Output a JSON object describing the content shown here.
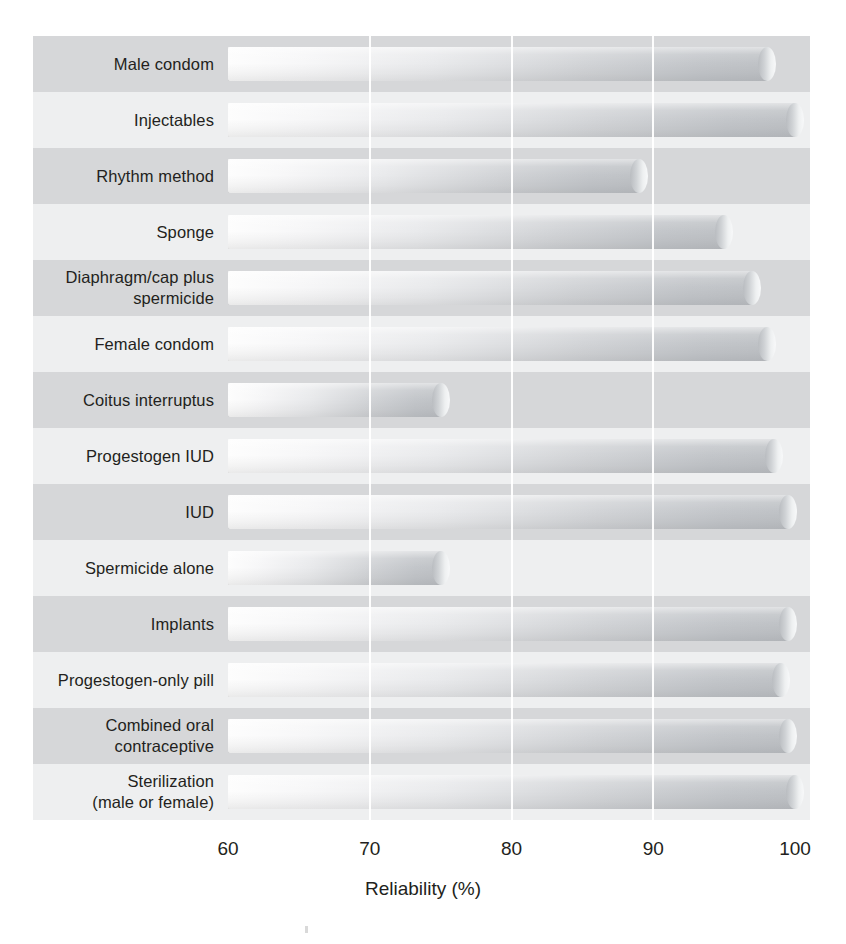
{
  "chart_data": {
    "type": "bar",
    "orientation": "horizontal",
    "title": "",
    "subtitle": "",
    "xlabel": "Reliability (%)",
    "ylabel": "",
    "xlim": [
      60,
      100
    ],
    "xticks": [
      60,
      70,
      80,
      90,
      100
    ],
    "xtick_labels": [
      "60",
      "70",
      "80",
      "90",
      "100"
    ],
    "grid": "vertical white gridlines at 70, 80, 90",
    "legend": "none",
    "bar_style": "3D cylindrical bars with left-to-right grey gradient and rounded right cap",
    "row_banding": "alternating light/dark grey horizontal bands",
    "categories": [
      "Male condom",
      "Injectables",
      "Rhythm method",
      "Sponge",
      "Diaphragm/cap plus spermicide",
      "Female condom",
      "Coitus interruptus",
      "Progestogen IUD",
      "IUD",
      "Spermicide alone",
      "Implants",
      "Progestogen-only pill",
      "Combined oral contraceptive",
      "Sterilization (male or female)"
    ],
    "values": [
      98,
      100,
      89,
      95,
      97,
      98,
      75,
      98.5,
      99.5,
      75,
      99.5,
      99,
      99.5,
      100
    ]
  },
  "axis": {
    "title": "Reliability (%)",
    "ticks": [
      {
        "label": "60",
        "value": 60
      },
      {
        "label": "70",
        "value": 70
      },
      {
        "label": "80",
        "value": 80
      },
      {
        "label": "90",
        "value": 90
      },
      {
        "label": "100",
        "value": 100
      }
    ]
  },
  "rows": [
    {
      "label_line1": "Male condom",
      "label_line2": "",
      "value": 98
    },
    {
      "label_line1": "Injectables",
      "label_line2": "",
      "value": 100
    },
    {
      "label_line1": "Rhythm method",
      "label_line2": "",
      "value": 89
    },
    {
      "label_line1": "Sponge",
      "label_line2": "",
      "value": 95
    },
    {
      "label_line1": "Diaphragm/cap plus",
      "label_line2": "spermicide",
      "value": 97
    },
    {
      "label_line1": "Female condom",
      "label_line2": "",
      "value": 98
    },
    {
      "label_line1": "Coitus interruptus",
      "label_line2": "",
      "value": 75
    },
    {
      "label_line1": "Progestogen IUD",
      "label_line2": "",
      "value": 98.5
    },
    {
      "label_line1": "IUD",
      "label_line2": "",
      "value": 99.5
    },
    {
      "label_line1": "Spermicide alone",
      "label_line2": "",
      "value": 75
    },
    {
      "label_line1": "Implants",
      "label_line2": "",
      "value": 99.5
    },
    {
      "label_line1": "Progestogen-only pill",
      "label_line2": "",
      "value": 99
    },
    {
      "label_line1": "Combined oral",
      "label_line2": "contraceptive",
      "value": 99.5
    },
    {
      "label_line1": "Sterilization",
      "label_line2": "(male or female)",
      "value": 100
    }
  ],
  "colors": {
    "band_dark": "#d6d7d9",
    "band_light": "#eeeff0",
    "bar_light_end": "#fdfdfd",
    "bar_dark_end": "#bfc2c6",
    "gridline": "#ffffff",
    "text": "#231f20"
  }
}
